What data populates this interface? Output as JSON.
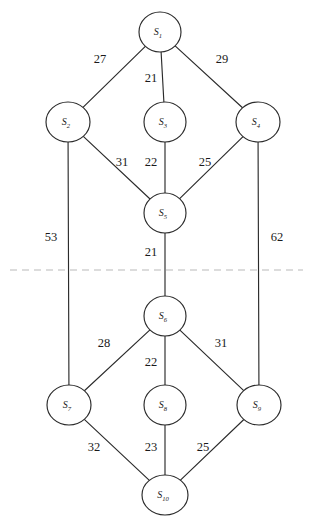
{
  "figure": {
    "width": 311,
    "height": 526,
    "background_color": "#ffffff",
    "stroke_color": "#2b2b2b",
    "partition_color": "#b9b9b9"
  },
  "nodes": [
    {
      "id": "S1",
      "label": "S",
      "subscript": "1",
      "cx": 160,
      "cy": 32,
      "rx": 21,
      "ry": 20
    },
    {
      "id": "S2",
      "label": "S",
      "subscript": "2",
      "cx": 68,
      "cy": 122,
      "rx": 22,
      "ry": 20
    },
    {
      "id": "S3",
      "label": "S",
      "subscript": "3",
      "cx": 165,
      "cy": 122,
      "rx": 21,
      "ry": 20
    },
    {
      "id": "S4",
      "label": "S",
      "subscript": "4",
      "cx": 258,
      "cy": 122,
      "rx": 22,
      "ry": 20
    },
    {
      "id": "S5",
      "label": "S",
      "subscript": "5",
      "cx": 165,
      "cy": 213,
      "rx": 21,
      "ry": 20
    },
    {
      "id": "S6",
      "label": "S",
      "subscript": "6",
      "cx": 165,
      "cy": 316,
      "rx": 21,
      "ry": 20
    },
    {
      "id": "S7",
      "label": "S",
      "subscript": "7",
      "cx": 69,
      "cy": 405,
      "rx": 22,
      "ry": 20
    },
    {
      "id": "S8",
      "label": "S",
      "subscript": "8",
      "cx": 165,
      "cy": 405,
      "rx": 21,
      "ry": 20
    },
    {
      "id": "S9",
      "label": "S",
      "subscript": "9",
      "cx": 259,
      "cy": 405,
      "rx": 22,
      "ry": 20
    },
    {
      "id": "S10",
      "label": "S",
      "subscript": "10",
      "cx": 165,
      "cy": 495,
      "rx": 23,
      "ry": 20
    }
  ],
  "edges": [
    {
      "id": "e-s1-s2",
      "from": "S1",
      "to": "S2",
      "weight": "27",
      "label_x": 100,
      "label_y": 60
    },
    {
      "id": "e-s1-s3",
      "from": "S1",
      "to": "S3",
      "weight": "21",
      "label_x": 151,
      "label_y": 79
    },
    {
      "id": "e-s1-s4",
      "from": "S1",
      "to": "S4",
      "weight": "29",
      "label_x": 222,
      "label_y": 60
    },
    {
      "id": "e-s2-s5",
      "from": "S2",
      "to": "S5",
      "weight": "31",
      "label_x": 122,
      "label_y": 163
    },
    {
      "id": "e-s3-s5",
      "from": "S3",
      "to": "S5",
      "weight": "22",
      "label_x": 151,
      "label_y": 163
    },
    {
      "id": "e-s4-s5",
      "from": "S4",
      "to": "S5",
      "weight": "25",
      "label_x": 205,
      "label_y": 163
    },
    {
      "id": "e-s2-s7",
      "from": "S2",
      "to": "S7",
      "weight": "53",
      "label_x": 51,
      "label_y": 238
    },
    {
      "id": "e-s5-s6",
      "from": "S5",
      "to": "S6",
      "weight": "21",
      "label_x": 151,
      "label_y": 253
    },
    {
      "id": "e-s4-s9",
      "from": "S4",
      "to": "S9",
      "weight": "62",
      "label_x": 277,
      "label_y": 238
    },
    {
      "id": "e-s6-s7",
      "from": "S6",
      "to": "S7",
      "weight": "28",
      "label_x": 104,
      "label_y": 344
    },
    {
      "id": "e-s6-s8",
      "from": "S6",
      "to": "S8",
      "weight": "22",
      "label_x": 151,
      "label_y": 363
    },
    {
      "id": "e-s6-s9",
      "from": "S6",
      "to": "S9",
      "weight": "31",
      "label_x": 221,
      "label_y": 344
    },
    {
      "id": "e-s7-s10",
      "from": "S7",
      "to": "S10",
      "weight": "32",
      "label_x": 94,
      "label_y": 448
    },
    {
      "id": "e-s8-s10",
      "from": "S8",
      "to": "S10",
      "weight": "23",
      "label_x": 151,
      "label_y": 448
    },
    {
      "id": "e-s9-s10",
      "from": "S9",
      "to": "S10",
      "weight": "25",
      "label_x": 203,
      "label_y": 448
    }
  ],
  "partition": {
    "id": "partition-divider",
    "x1": 10,
    "x2": 303,
    "y": 270
  }
}
